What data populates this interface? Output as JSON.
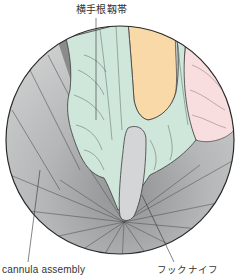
{
  "figure": {
    "view": "endoscopic-circular-view",
    "labels": {
      "top": "横手根靱帯",
      "bottom_left": "cannula assembly",
      "bottom_right": "フックナイフ"
    },
    "colors": {
      "ligament_green": "#cfe6da",
      "fat_orange": "#f9d9a8",
      "synovium_pink": "#f8dede",
      "cannula_gray": "#c4c6c6",
      "cannula_gray_dark": "#9a9c9c",
      "knife_gray": "#d3d5d6",
      "outline": "#3a3a3a"
    }
  }
}
